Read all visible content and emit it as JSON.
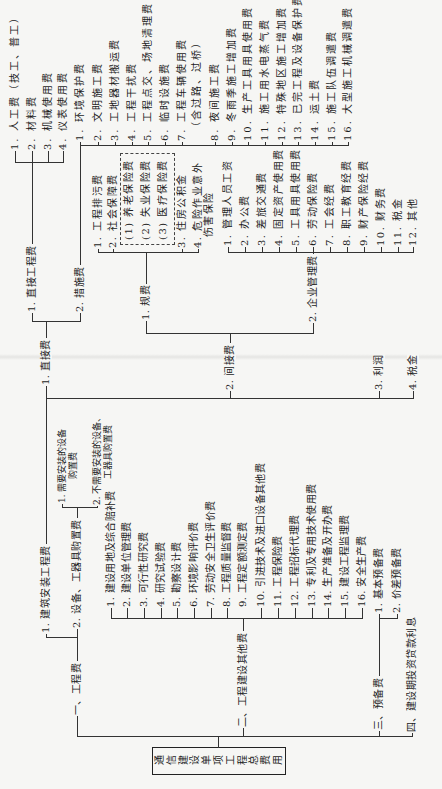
{
  "root": {
    "label": "通信建设单项工程总费用"
  },
  "engineering_fee": {
    "label": "一、工程费",
    "install": {
      "label": "1. 建筑安装工程费",
      "direct": {
        "label": "1. 直接费",
        "direct_engineering": {
          "label": "1. 直接工程费",
          "items": [
            "1. 人工费（技工、普工）",
            "2. 材料费",
            "3. 机械使用费",
            "4. 仪表使用费"
          ]
        },
        "measures": {
          "label": "2. 措施费",
          "items": [
            "1. 环境保护费",
            "2. 文明施工费",
            "3. 工地器材搬运费",
            "4. 工程干扰费",
            "5. 工程点交、场地清理费",
            "6. 临时设施费",
            "7. 工程车辆使用费",
            "8. 夜间施工费",
            "9. 冬雨季施工增加费",
            "10. 生产工具用具使用费",
            "11. 施工用水电蒸气费",
            "12. 特殊地区施工增加费",
            "13. 已完工程及设备保护费",
            "14. 运土费",
            "15. 施工队伍调遣费",
            "16. 大型施工机械调遣费"
          ],
          "item7_line2": "（含过路、过桥）"
        }
      },
      "indirect": {
        "label": "2. 间接费",
        "regulatory": {
          "label": "1. 规费",
          "items": [
            "1. 工程排污费",
            "2. 社会保障费",
            "3. 住房公积金",
            "4. 危险作业意外"
          ],
          "item4_line2": "伤害保险",
          "social_security_breakdown": [
            "(1) 养老保险费",
            "(2) 失业保险费",
            "(3) 医疗保险费"
          ]
        },
        "management": {
          "label": "2. 企业管理费",
          "items": [
            "1. 管理人员工资",
            "2. 办公费",
            "3. 差旅交通费",
            "4. 固定资产使用费",
            "5. 工具用具使用费",
            "6. 劳动保险费",
            "7. 工会经费",
            "8. 职工教育经费",
            "9. 财产保险经费",
            "10. 财务费",
            "11. 税金",
            "12. 其他"
          ]
        }
      },
      "profit": "3. 利润",
      "tax": "4. 税金"
    },
    "equipment": {
      "label": "2. 设备、工器具购置费",
      "items": [
        {
          "line1": "1. 需要安装的设备",
          "line2": "购置费"
        },
        {
          "line1": "2. 不需要安装的设备、",
          "line2": "工器具购置费"
        }
      ]
    }
  },
  "other_fee": {
    "label": "二、工程建设其他费",
    "items": [
      "1. 建设用地及综合赔补费",
      "2. 建设单位管理费",
      "3. 可行性研究费",
      "4. 研究试验费",
      "5. 勘察设计费",
      "6. 环境影响评价费",
      "7. 劳动安全卫生评价费",
      "8. 工程质量监督费",
      "9. 工程定额测定费",
      "10. 引进技术及进口设备其他费",
      "11. 工程保险费",
      "12. 工程招标代理费",
      "13. 专利及专用技术使用费",
      "14. 生产准备及开办费",
      "15. 建设工程监理费",
      "16. 安全生产费"
    ]
  },
  "reserve_fee": {
    "label": "三、预备费",
    "items": [
      "1. 基本预备费",
      "2. 价差预备费"
    ]
  },
  "loan_interest": {
    "label": "四、建设期投资贷款利息"
  },
  "colors": {
    "line": "#333333",
    "text": "#1c1c1c",
    "background": "#f6f6f4"
  }
}
